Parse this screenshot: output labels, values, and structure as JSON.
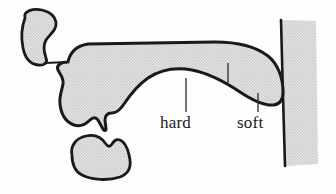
{
  "figure": {
    "name": "sagittal-palate-diagram",
    "width": 336,
    "height": 194,
    "background_color": "#fdfdfd"
  },
  "style": {
    "outline_color": "#1a1a1a",
    "fill_color": "#dcdcdc",
    "stipple_dot_color": "#b8b8b8",
    "leader_line_color": "#2a2a2a",
    "label_color": "#1a1a1a",
    "outline_width": "3",
    "leader_width": "1.2"
  },
  "labels": [
    {
      "id": "hard",
      "text": "hard",
      "x": 160,
      "y": 128,
      "leader": {
        "x": 186,
        "y_top": 78,
        "y_bottom": 112
      }
    },
    {
      "id": "soft",
      "text": "soft",
      "x": 237,
      "y": 128,
      "leader": {
        "x": 258,
        "y_top": 93,
        "y_bottom": 112
      }
    }
  ],
  "boundary_tick": {
    "id": "hard-soft-boundary-tick",
    "x": 228,
    "y_top": 63,
    "y_bottom": 86
  },
  "shapes": [
    {
      "id": "upper-lip",
      "name": "upper-lip-shape"
    },
    {
      "id": "palate-mass",
      "name": "palate-and-tongue-mass-shape"
    },
    {
      "id": "lower-lip",
      "name": "lower-lip-shape"
    },
    {
      "id": "pharyngeal-wall",
      "name": "pharyngeal-wall-band"
    },
    {
      "id": "lip-connector",
      "name": "lip-to-palate-connector-line"
    }
  ]
}
